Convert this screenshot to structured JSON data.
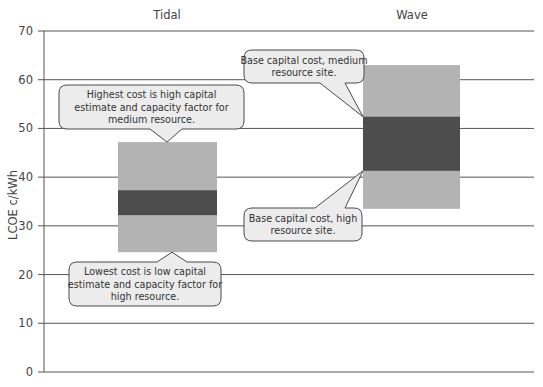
{
  "chart_data": {
    "type": "bar",
    "subtype": "floating-range",
    "title": "",
    "xlabel": "",
    "ylabel": "LCOE c/kWh",
    "ylim": [
      0,
      70
    ],
    "yticks": [
      0,
      10,
      20,
      30,
      40,
      50,
      60,
      70
    ],
    "grid": true,
    "legend": null,
    "categories": [
      "Tidal",
      "Wave"
    ],
    "series": [
      {
        "name": "Full cost range",
        "color": "#b3b3b3",
        "low": [
          24.6,
          33.5
        ],
        "high": [
          47.2,
          63.0
        ]
      },
      {
        "name": "Base capital cost range",
        "color": "#4d4d4d",
        "low": [
          32.2,
          41.3
        ],
        "high": [
          37.3,
          52.4
        ]
      }
    ],
    "annotations": [
      {
        "id": "tidal-high",
        "category": "Tidal",
        "points_to": 47.2,
        "lines": [
          "Highest cost is high capital",
          "estimate and capacity factor for",
          "medium resource."
        ]
      },
      {
        "id": "tidal-low",
        "category": "Tidal",
        "points_to": 24.6,
        "lines": [
          "Lowest cost is low capital",
          "estimate and capacity factor for",
          "high resource."
        ]
      },
      {
        "id": "wave-medium",
        "category": "Wave",
        "points_to": 52.4,
        "lines": [
          "Base capital cost, medium",
          "resource site."
        ]
      },
      {
        "id": "wave-high",
        "category": "Wave",
        "points_to": 41.3,
        "lines": [
          "Base capital cost, high",
          "resource site."
        ]
      }
    ]
  },
  "colors": {
    "gridline": "#555555",
    "axis": "#555555",
    "callout_fill": "#ececec",
    "callout_border": "#4a4a4a"
  }
}
